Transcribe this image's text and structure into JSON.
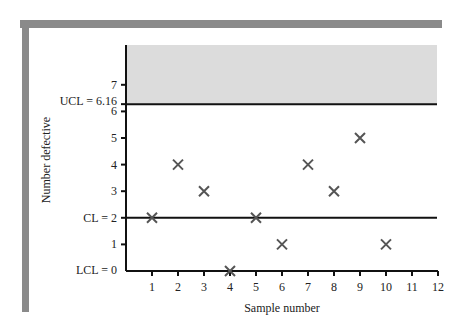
{
  "chart_data": {
    "type": "scatter",
    "title": "",
    "xlabel": "Sample number",
    "ylabel": "Number defective",
    "x": [
      1,
      2,
      3,
      4,
      5,
      6,
      7,
      8,
      9,
      10
    ],
    "values": [
      2,
      4,
      3,
      0,
      2,
      1,
      4,
      3,
      5,
      1
    ],
    "marker": "x",
    "x_ticks": [
      "1",
      "2",
      "3",
      "4",
      "5",
      "6",
      "7",
      "8",
      "9",
      "10",
      "11",
      "12"
    ],
    "y_ticks": [
      "1",
      "3",
      "4",
      "5",
      "6",
      "7"
    ],
    "xlim": [
      0,
      12
    ],
    "ylim": [
      0,
      8.5
    ],
    "grid": false,
    "legend": "none",
    "control_limits": {
      "ucl": {
        "label": "UCL = 6.16",
        "value": 6.16
      },
      "cl": {
        "label": "CL = 2",
        "value": 2
      },
      "lcl": {
        "label": "LCL = 0",
        "value": 0
      }
    },
    "shaded_region": {
      "from": 6.16,
      "to": 8.5,
      "meaning": "out of control above UCL"
    }
  },
  "colors": {
    "frame": "#8a8a8a",
    "shade": "#dcdcdc",
    "axis": "#111111",
    "marker": "#555555"
  }
}
